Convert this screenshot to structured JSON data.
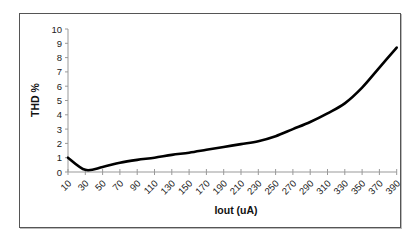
{
  "chart_data": {
    "type": "line",
    "title": "",
    "xlabel": "Iout (uA)",
    "ylabel": "THD %",
    "categories": [
      "10",
      "30",
      "50",
      "70",
      "90",
      "110",
      "130",
      "150",
      "170",
      "190",
      "210",
      "230",
      "250",
      "270",
      "290",
      "310",
      "330",
      "350",
      "370",
      "390"
    ],
    "series": [
      {
        "name": "THD",
        "values": [
          1.0,
          0.15,
          0.35,
          0.65,
          0.85,
          1.0,
          1.2,
          1.35,
          1.55,
          1.75,
          1.95,
          2.15,
          2.5,
          3.0,
          3.5,
          4.1,
          4.8,
          5.9,
          7.3,
          8.7
        ]
      }
    ],
    "ylim": [
      0,
      10
    ],
    "yticks": [
      0,
      1,
      2,
      3,
      4,
      5,
      6,
      7,
      8,
      9,
      10
    ],
    "grid": false,
    "legend": "none",
    "line_color": "#000000"
  }
}
